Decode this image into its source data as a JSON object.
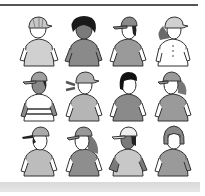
{
  "illustration": {
    "description": "Grid of twelve cartoon children in t-shirts, many wearing baseball caps",
    "rows": 3,
    "columns": 4,
    "figures": [
      {
        "id": 1,
        "headwear": "cap",
        "hair": "light",
        "shirt": "#d0d0d0",
        "skin": "#ffffff"
      },
      {
        "id": 2,
        "headwear": "none",
        "hair": "dark-curly",
        "shirt": "#8a8a8a",
        "skin": "#8a8a8a"
      },
      {
        "id": 3,
        "headwear": "cap",
        "hair": "dark",
        "shirt": "#9a9a9a",
        "skin": "#ffffff"
      },
      {
        "id": 4,
        "headwear": "cap",
        "hair": "long-gray",
        "shirt": "#ffffff",
        "skin": "#ffffff"
      },
      {
        "id": 5,
        "headwear": "cap",
        "hair": "dark",
        "shirt": "#ffffff",
        "skin": "#8a8a8a",
        "stripes": true
      },
      {
        "id": 6,
        "headwear": "cap",
        "hair": "pigtails",
        "shirt": "#b5b5b5",
        "skin": "#ffffff"
      },
      {
        "id": 7,
        "headwear": "none",
        "hair": "black",
        "shirt": "#8a8a8a",
        "skin": "#ffffff"
      },
      {
        "id": 8,
        "headwear": "cap",
        "hair": "long-gray",
        "shirt": "#9a9a9a",
        "skin": "#ffffff"
      },
      {
        "id": 9,
        "headwear": "cap-backwards",
        "hair": "dark",
        "shirt": "#bcbcbc",
        "skin": "#ffffff"
      },
      {
        "id": 10,
        "headwear": "cap",
        "hair": "long-gray",
        "shirt": "#8e8e8e",
        "skin": "#ffffff"
      },
      {
        "id": 11,
        "headwear": "cap",
        "hair": "dark",
        "shirt": "#c8c8c8",
        "skin": "#7a7a7a"
      },
      {
        "id": 12,
        "headwear": "helmet-hair",
        "hair": "gray-bob",
        "shirt": "#9a9a9a",
        "skin": "#ffffff"
      }
    ]
  }
}
